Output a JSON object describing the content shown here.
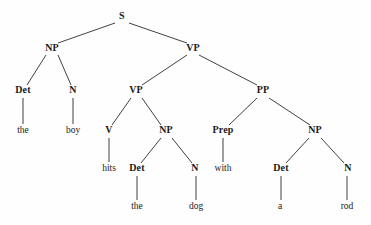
{
  "figure": {
    "name": "syntax-tree",
    "background_color": "#fefefe",
    "line_color": "#2b2b2b",
    "text_color": "#1a1a1a"
  },
  "tree": {
    "nodes": [
      {
        "id": "S",
        "label": "S",
        "kind": "category",
        "x": 122,
        "y": 19
      },
      {
        "id": "NP1",
        "label": "NP",
        "kind": "category",
        "x": 52,
        "y": 51
      },
      {
        "id": "VP1",
        "label": "VP",
        "kind": "category",
        "x": 193,
        "y": 51
      },
      {
        "id": "Det1",
        "label": "Det",
        "kind": "category",
        "x": 23,
        "y": 93
      },
      {
        "id": "N1",
        "label": "N",
        "kind": "category",
        "x": 73,
        "y": 93
      },
      {
        "id": "VP2",
        "label": "VP",
        "kind": "category",
        "x": 136,
        "y": 93
      },
      {
        "id": "PP1",
        "label": "PP",
        "kind": "category",
        "x": 263,
        "y": 93
      },
      {
        "id": "the1",
        "label": "the",
        "kind": "word",
        "x": 23,
        "y": 133
      },
      {
        "id": "boy1",
        "label": "boy",
        "kind": "word",
        "x": 73,
        "y": 133
      },
      {
        "id": "V1",
        "label": "V",
        "kind": "category",
        "x": 109,
        "y": 133
      },
      {
        "id": "NP2",
        "label": "NP",
        "kind": "category",
        "x": 166,
        "y": 133
      },
      {
        "id": "Prep1",
        "label": "Prep",
        "kind": "category",
        "x": 223,
        "y": 133
      },
      {
        "id": "NP3",
        "label": "NP",
        "kind": "category",
        "x": 315,
        "y": 133
      },
      {
        "id": "hits1",
        "label": "hits",
        "kind": "word",
        "x": 109,
        "y": 171
      },
      {
        "id": "Det2",
        "label": "Det",
        "kind": "category",
        "x": 137,
        "y": 171
      },
      {
        "id": "N2",
        "label": "N",
        "kind": "category",
        "x": 195,
        "y": 171
      },
      {
        "id": "with1",
        "label": "with",
        "kind": "word",
        "x": 223,
        "y": 171
      },
      {
        "id": "Det3",
        "label": "Det",
        "kind": "category",
        "x": 281,
        "y": 171
      },
      {
        "id": "N3",
        "label": "N",
        "kind": "category",
        "x": 348,
        "y": 171
      },
      {
        "id": "the2",
        "label": "the",
        "kind": "word",
        "x": 137,
        "y": 209
      },
      {
        "id": "dog1",
        "label": "dog",
        "kind": "word",
        "x": 196,
        "y": 209
      },
      {
        "id": "a1",
        "label": "a",
        "kind": "word",
        "x": 280,
        "y": 209
      },
      {
        "id": "rod1",
        "label": "rod",
        "kind": "word",
        "x": 347,
        "y": 209
      }
    ],
    "edges": [
      {
        "from": "S",
        "to": "NP1",
        "x1": 115,
        "y1": 23,
        "x2": 58,
        "y2": 43
      },
      {
        "from": "S",
        "to": "VP1",
        "x1": 129,
        "y1": 23,
        "x2": 187,
        "y2": 43
      },
      {
        "from": "NP1",
        "to": "Det1",
        "x1": 46,
        "y1": 55,
        "x2": 27,
        "y2": 85
      },
      {
        "from": "NP1",
        "to": "N1",
        "x1": 58,
        "y1": 55,
        "x2": 71,
        "y2": 85
      },
      {
        "from": "VP1",
        "to": "VP2",
        "x1": 187,
        "y1": 55,
        "x2": 142,
        "y2": 85
      },
      {
        "from": "VP1",
        "to": "PP1",
        "x1": 199,
        "y1": 55,
        "x2": 257,
        "y2": 85
      },
      {
        "from": "Det1",
        "to": "the1",
        "x1": 23,
        "y1": 98,
        "x2": 23,
        "y2": 124
      },
      {
        "from": "N1",
        "to": "boy1",
        "x1": 73,
        "y1": 98,
        "x2": 73,
        "y2": 124
      },
      {
        "from": "VP2",
        "to": "V1",
        "x1": 131,
        "y1": 98,
        "x2": 112,
        "y2": 125
      },
      {
        "from": "VP2",
        "to": "NP2",
        "x1": 142,
        "y1": 98,
        "x2": 161,
        "y2": 125
      },
      {
        "from": "PP1",
        "to": "Prep1",
        "x1": 257,
        "y1": 98,
        "x2": 229,
        "y2": 125
      },
      {
        "from": "PP1",
        "to": "NP3",
        "x1": 269,
        "y1": 98,
        "x2": 310,
        "y2": 125
      },
      {
        "from": "V1",
        "to": "hits1",
        "x1": 109,
        "y1": 138,
        "x2": 109,
        "y2": 162
      },
      {
        "from": "NP2",
        "to": "Det2",
        "x1": 161,
        "y1": 138,
        "x2": 141,
        "y2": 163
      },
      {
        "from": "NP2",
        "to": "N2",
        "x1": 172,
        "y1": 138,
        "x2": 192,
        "y2": 163
      },
      {
        "from": "Prep1",
        "to": "with1",
        "x1": 223,
        "y1": 138,
        "x2": 223,
        "y2": 162
      },
      {
        "from": "NP3",
        "to": "Det3",
        "x1": 309,
        "y1": 138,
        "x2": 286,
        "y2": 163
      },
      {
        "from": "NP3",
        "to": "N3",
        "x1": 321,
        "y1": 138,
        "x2": 344,
        "y2": 163
      },
      {
        "from": "Det2",
        "to": "the2",
        "x1": 137,
        "y1": 176,
        "x2": 137,
        "y2": 200
      },
      {
        "from": "N2",
        "to": "dog1",
        "x1": 196,
        "y1": 176,
        "x2": 196,
        "y2": 200
      },
      {
        "from": "Det3",
        "to": "a1",
        "x1": 281,
        "y1": 176,
        "x2": 281,
        "y2": 200
      },
      {
        "from": "N3",
        "to": "rod1",
        "x1": 347,
        "y1": 176,
        "x2": 347,
        "y2": 200
      }
    ]
  }
}
